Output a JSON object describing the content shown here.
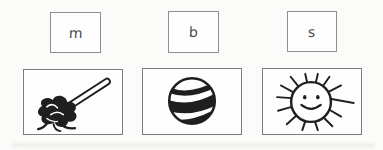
{
  "worksheet": {
    "colors": {
      "background": "#fbfbfa",
      "ink": "#1f1f1f",
      "letter_ink": "#4a4a4a",
      "letter_box_border": "#8f8f8f",
      "picture_box_border": "#7e7e7e"
    },
    "letters": [
      {
        "label": "m"
      },
      {
        "label": "b"
      },
      {
        "label": "s"
      }
    ],
    "pictures": [
      {
        "icon": "mop-icon",
        "alt": "mop"
      },
      {
        "icon": "ball-icon",
        "alt": "ball"
      },
      {
        "icon": "sun-icon",
        "alt": "sun"
      }
    ]
  }
}
